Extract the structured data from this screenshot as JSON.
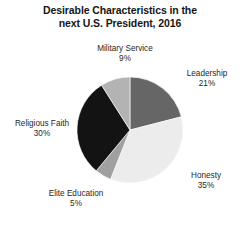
{
  "chart_data": {
    "type": "pie",
    "title": "Desirable Characteristics in the next U.S. President, 2016",
    "title_lines": [
      "Desirable Characteristics in the",
      "next U.S. President, 2016"
    ],
    "xlabel": "",
    "ylabel": "",
    "grid": false,
    "legend_position": "none",
    "label_style": "outside-callout",
    "start_angle_deg": 0,
    "direction": "clockwise",
    "units": "percent",
    "total": 100,
    "categories": [
      "Leadership",
      "Honesty",
      "Elite Education",
      "Religious Faith",
      "Military Service"
    ],
    "values": [
      21,
      35,
      5,
      30,
      9
    ],
    "slices": [
      {
        "name": "Leadership",
        "value": 21,
        "value_label": "21%",
        "color": "#666666",
        "order": 1,
        "label_position": "right-upper"
      },
      {
        "name": "Honesty",
        "value": 35,
        "value_label": "35%",
        "color": "#ececed",
        "order": 2,
        "label_position": "right-lower"
      },
      {
        "name": "Elite Education",
        "value": 5,
        "value_label": "5%",
        "color": "#a0a0a0",
        "order": 3,
        "label_position": "bottom-left"
      },
      {
        "name": "Religious Faith",
        "value": 30,
        "value_label": "30%",
        "color": "#131313",
        "order": 4,
        "label_position": "left"
      },
      {
        "name": "Military Service",
        "value": 9,
        "value_label": "9%",
        "color": "#b3b3b3",
        "order": 5,
        "label_position": "top"
      }
    ],
    "geometry": {
      "center_x": 130,
      "center_y": 130,
      "radius": 53,
      "stroke_color": "#ffffff",
      "stroke_width": 0.6
    }
  }
}
